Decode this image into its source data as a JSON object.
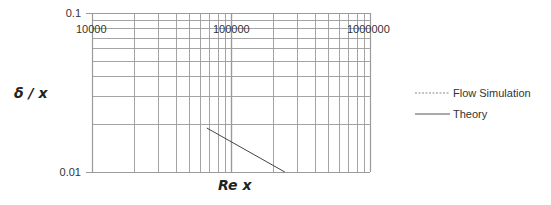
{
  "chart_data": {
    "type": "line",
    "title": "",
    "xlabel": "Re x",
    "ylabel": "δ / x",
    "xscale": "log",
    "yscale": "log",
    "xlim": [
      10000,
      1000000
    ],
    "ylim": [
      0.01,
      0.1
    ],
    "x_tick_labels": [
      "10000",
      "100000",
      "1000000"
    ],
    "y_tick_labels": [
      "0.1",
      "0.01"
    ],
    "grid": true,
    "legend_position": "right",
    "series": [
      {
        "name": "Flow Simulation",
        "style": "dashed",
        "x": [],
        "y": []
      },
      {
        "name": "Theory",
        "style": "solid",
        "x": [
          67000,
          244000
        ],
        "y": [
          0.0189,
          0.01
        ]
      }
    ]
  },
  "legend": {
    "items": [
      {
        "label": "Flow Simulation",
        "style": "dashed"
      },
      {
        "label": "Theory",
        "style": "solid"
      }
    ]
  },
  "colors": {
    "grid": "#9a9a9a",
    "axis": "#888888",
    "series_line": "#444444",
    "legend_dashed": "#8a8a8a"
  }
}
